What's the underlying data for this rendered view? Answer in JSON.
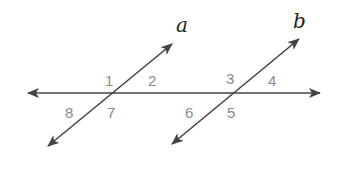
{
  "diagram": {
    "type": "parallel lines cut by a transversal",
    "lines": {
      "a": {
        "label": "a"
      },
      "b": {
        "label": "b"
      }
    },
    "angles": [
      {
        "id": "1",
        "label": "1"
      },
      {
        "id": "2",
        "label": "2"
      },
      {
        "id": "3",
        "label": "3"
      },
      {
        "id": "4",
        "label": "4"
      },
      {
        "id": "5",
        "label": "5"
      },
      {
        "id": "6",
        "label": "6"
      },
      {
        "id": "7",
        "label": "7"
      },
      {
        "id": "8",
        "label": "8"
      }
    ],
    "colors": {
      "line": "#444444",
      "angle_label": "#8a8a8a",
      "variable_label": "#222222"
    }
  }
}
